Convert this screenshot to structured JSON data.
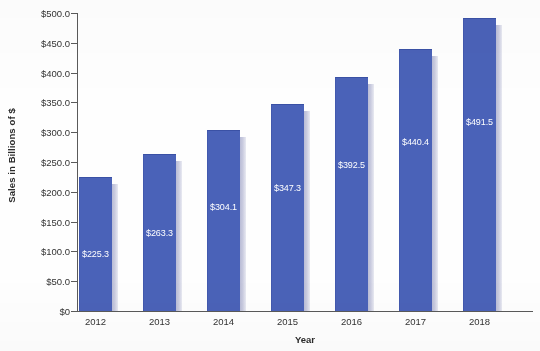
{
  "chart_data": {
    "type": "bar",
    "title": "",
    "xlabel": "Year",
    "ylabel": "Sales in Billions of $",
    "categories": [
      "2012",
      "2013",
      "2014",
      "2015",
      "2016",
      "2017",
      "2018"
    ],
    "values": [
      225.3,
      263.3,
      304.1,
      347.3,
      392.5,
      440.4,
      491.5
    ],
    "data_labels": [
      "$225.3",
      "$263.3",
      "$304.1",
      "$347.3",
      "$392.5",
      "$440.4",
      "$491.5"
    ],
    "ylim": [
      0,
      500
    ],
    "ytick_values": [
      0,
      50,
      100,
      150,
      200,
      250,
      300,
      350,
      400,
      450,
      500
    ],
    "ytick_labels": [
      "$0",
      "$50.0",
      "$100.0",
      "$150.0",
      "$200.0",
      "$250.0",
      "$300.0",
      "$350.0",
      "$400.0",
      "$450.0",
      "$500.0"
    ],
    "grid": false,
    "legend": "none",
    "series": [
      {
        "name": "Sales",
        "values": [
          225.3,
          263.3,
          304.1,
          347.3,
          392.5,
          440.4,
          491.5
        ]
      }
    ],
    "colors": {
      "bar": "#4a62b8",
      "bar_border": "#3a51a5",
      "bar_shadow": "#c2c5db",
      "axis": "#5a5a5a",
      "label_text": "#ffffff",
      "tick_text": "#333333",
      "background": "#ffffff"
    },
    "label_offsets_px": [
      249,
      228,
      202,
      183,
      160,
      137,
      117
    ]
  }
}
